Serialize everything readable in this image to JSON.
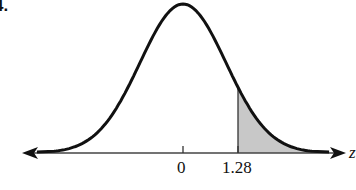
{
  "problem": {
    "label": "4."
  },
  "chart_data": {
    "type": "area",
    "title": "",
    "xlabel": "z",
    "ylabel": "",
    "distribution": "standard normal",
    "mean": 0,
    "tick_labels": [
      "0",
      "1.28"
    ],
    "ticks": [
      0,
      1.28
    ],
    "shaded_region": {
      "from": 1.28,
      "to": "infinity",
      "side": "right"
    },
    "xlim": [
      -3.5,
      3.5
    ],
    "grid": false,
    "legend": false,
    "colors": {
      "curve": "#111111",
      "shade": "#c8c8c8",
      "axis": "#333333"
    }
  }
}
